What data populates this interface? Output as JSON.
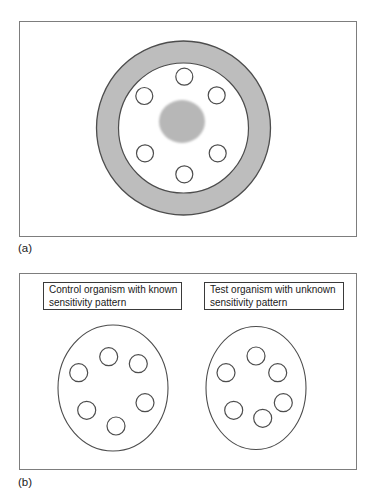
{
  "caption_top": {
    "text": "ARRANGEMENT OF THE SENSITIVITY DISCS ON THE CULTURE PLATE"
  },
  "colors": {
    "ring_gray": "#bdbdbd",
    "zone_gray": "#b7b7b7",
    "outline": "#4d4d4d",
    "panel_border": "#7d7d7d",
    "box_border": "#3a3a3a",
    "disc_fill": "#ffffff"
  },
  "panel_a": {
    "label": "(a)",
    "dish": {
      "cx": 163.5,
      "cy": 106,
      "outer_r": 87,
      "inner_r": 65
    },
    "central_zone": {
      "cx": 162,
      "cy": 99.5,
      "rx": 23,
      "ry": 21.5
    },
    "disc_r": 8.5,
    "discs": [
      [
        164.3,
        54.7
      ],
      [
        124.3,
        74.0
      ],
      [
        196.7,
        73.3
      ],
      [
        125.0,
        131.3
      ],
      [
        197.7,
        131.3
      ],
      [
        164.3,
        152.3
      ]
    ]
  },
  "panel_b": {
    "label": "(b)",
    "disc_r": 9,
    "left": {
      "caption": "Control organism with known sensitivity pattern",
      "lines": [
        "Control organism with known",
        "sensitivity pattern"
      ],
      "ellipse": {
        "cx": 93,
        "cy": 114,
        "rx": 55,
        "ry": 63
      },
      "discs": [
        [
          88.7,
          82.7
        ],
        [
          58.7,
          98.7
        ],
        [
          118.3,
          89.7
        ],
        [
          125.0,
          128.7
        ],
        [
          66.7,
          136.3
        ],
        [
          96.0,
          152.0
        ]
      ]
    },
    "right": {
      "caption": "Test organism with unknown sensitivity pattern",
      "lines": [
        "Test organism with unknown",
        "sensitivity pattern"
      ],
      "ellipse": {
        "cx": 236,
        "cy": 114,
        "rx": 50,
        "ry": 61.5
      },
      "discs": [
        [
          236.0,
          82.0
        ],
        [
          206.0,
          98.7
        ],
        [
          257.7,
          98.7
        ],
        [
          263.3,
          128.7
        ],
        [
          213.7,
          136.3
        ],
        [
          242.7,
          144.3
        ]
      ]
    }
  }
}
